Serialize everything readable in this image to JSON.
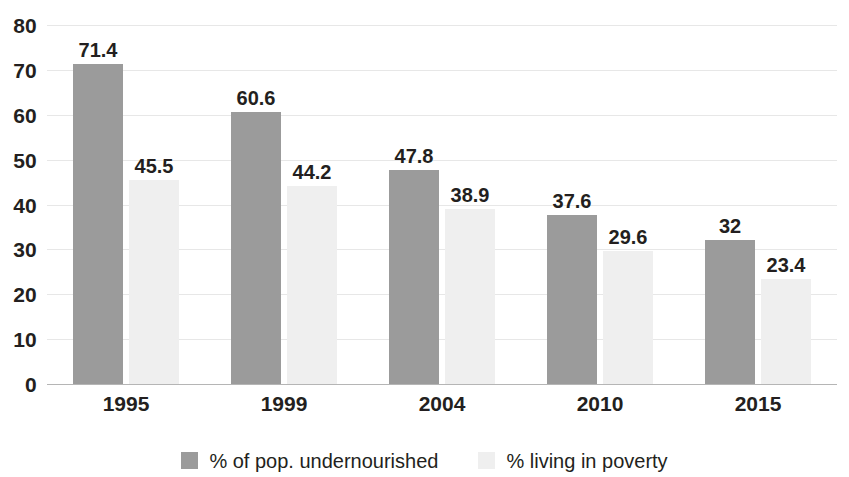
{
  "chart_data": {
    "type": "bar",
    "title": "",
    "subtitle": "",
    "xlabel": "",
    "ylabel": "",
    "categories": [
      "1995",
      "1999",
      "2004",
      "2010",
      "2015"
    ],
    "series": [
      {
        "name": "% of pop. undernourished",
        "color": "#9b9b9b",
        "values": [
          71.4,
          60.6,
          47.8,
          37.6,
          32
        ],
        "labels": [
          "71.4",
          "60.6",
          "47.8",
          "37.6",
          "32"
        ]
      },
      {
        "name": "% living in poverty",
        "color": "#efefef",
        "values": [
          45.5,
          44.2,
          38.9,
          29.6,
          23.4
        ],
        "labels": [
          "45.5",
          "44.2",
          "38.9",
          "29.6",
          "23.4"
        ]
      }
    ],
    "ylim": [
      0,
      80
    ],
    "yticks": [
      0,
      10,
      20,
      30,
      40,
      50,
      60,
      70,
      80
    ],
    "ytick_labels": [
      "0",
      "10",
      "20",
      "30",
      "40",
      "50",
      "60",
      "70",
      "80"
    ],
    "grid": true,
    "grid_axis": "y",
    "legend_position": "bottom",
    "legend": [
      "% of pop. undernourished",
      "% living in poverty"
    ]
  },
  "colors": {
    "series_0": "#9b9b9b",
    "series_1": "#efefef",
    "gridline": "#e7e7e7",
    "axis": "#b5b5b5",
    "text": "#231f20",
    "background": "#ffffff"
  }
}
